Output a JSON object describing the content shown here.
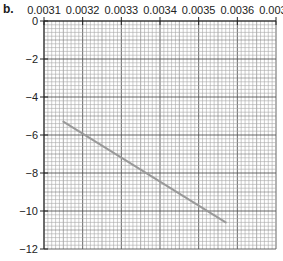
{
  "panel_label": "b.",
  "chart_data": {
    "type": "line",
    "title": "",
    "xlabel": "",
    "ylabel": "",
    "x_axis_position": "top",
    "x_ticks": [
      "0.0031",
      "0.0032",
      "0.0033",
      "0.0034",
      "0.0035",
      "0.0036",
      "0.0037"
    ],
    "y_ticks": [
      "0",
      "−2",
      "−4",
      "−6",
      "−8",
      "−10",
      "−12"
    ],
    "xlim": [
      0.0031,
      0.0037
    ],
    "ylim": [
      -12,
      0
    ],
    "grid": true,
    "grid_style": "graph paper, fine minor grid",
    "series": [
      {
        "name": "line",
        "color": "#9a9a9a",
        "x": [
          0.00315,
          0.00357
        ],
        "y": [
          -5.3,
          -10.6
        ]
      }
    ]
  },
  "layout": {
    "plot_left": 44,
    "plot_top": 21,
    "plot_right": 276,
    "plot_bottom": 249
  }
}
